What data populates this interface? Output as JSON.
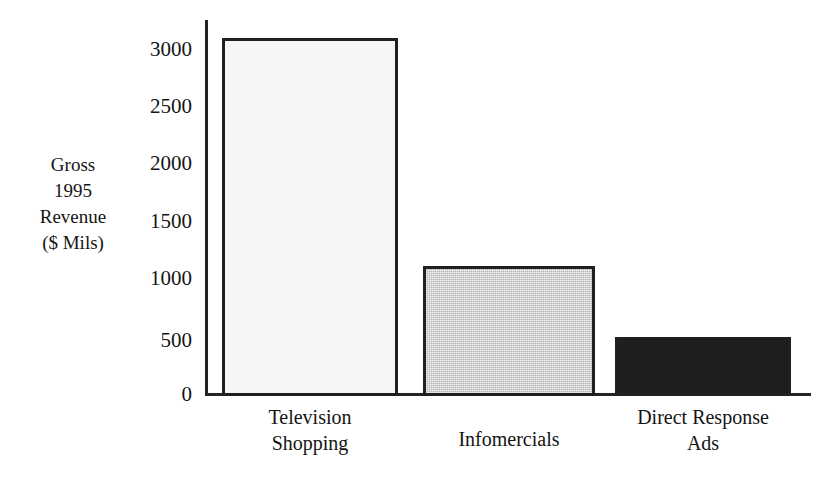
{
  "chart_data": {
    "type": "bar",
    "title": "",
    "subtitle": "",
    "categories": [
      "Television Shopping",
      "Infomercials",
      "Direct Response Ads"
    ],
    "values": [
      3100,
      1110,
      490
    ],
    "xlabel": "",
    "ylabel": "Gross 1995 Revenue ($ Mils)",
    "ylim": [
      0,
      3000
    ],
    "yticks": [
      0,
      500,
      1000,
      1500,
      2000,
      2500,
      3000
    ],
    "ytick_labels": [
      "0",
      "500",
      "1000",
      "1500",
      "2000",
      "2500",
      "3000"
    ],
    "grid": false,
    "legend": "none",
    "bar_styles": [
      "light-fill-outlined",
      "gray-halftone-outlined",
      "solid-black-outlined"
    ],
    "colors": {
      "bar_television_shopping": "#f6f6f6",
      "bar_infomercials": "#b4b4b4",
      "bar_direct_response_ads": "#1e1e1e",
      "outline": "#202020",
      "axis": "#242424",
      "text": "#141414"
    }
  },
  "axis_title_lines": [
    {
      "text": "Gross"
    },
    {
      "text": "1995"
    },
    {
      "text": "Revenue"
    },
    {
      "text": "($ Mils)"
    }
  ],
  "y_ticks": [
    {
      "label": "3000"
    },
    {
      "label": "2500"
    },
    {
      "label": "2000"
    },
    {
      "label": "1500"
    },
    {
      "label": "1000"
    },
    {
      "label": "500"
    },
    {
      "label": "0"
    }
  ],
  "category_labels": [
    {
      "line1": "Television",
      "line2": "Shopping"
    },
    {
      "line1": "Infomercials",
      "line2": ""
    },
    {
      "line1": "Direct Response",
      "line2": "Ads"
    }
  ]
}
